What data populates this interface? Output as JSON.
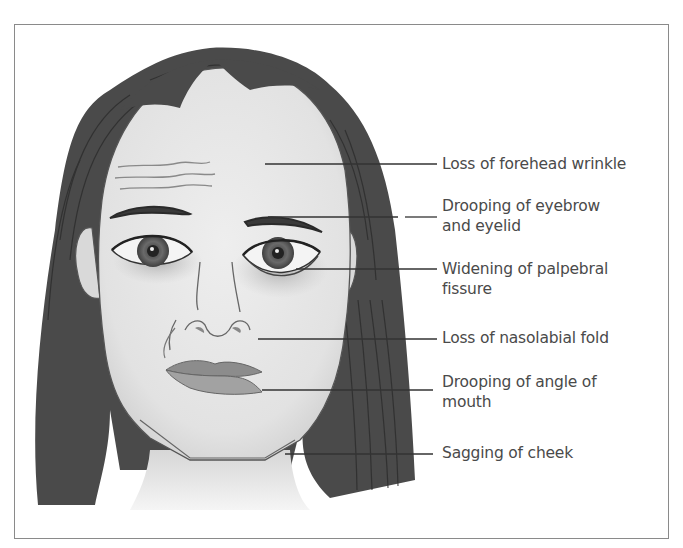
{
  "figure": {
    "colors": {
      "hair": "#4a4a4a",
      "skin": "#e6e6e6",
      "outline": "#555555",
      "lips": "#8c8c8c",
      "label_text": "#4a4a4a",
      "leader_line": "#333333",
      "frame": "#8a8a8a"
    },
    "labels": [
      {
        "text_lines": [
          "Loss of forehead wrinkle"
        ],
        "target": "forehead"
      },
      {
        "text_lines": [
          "Drooping of eyebrow",
          "and eyelid"
        ],
        "target": "left-eyebrow"
      },
      {
        "text_lines": [
          "Widening of palpebral",
          "fissure"
        ],
        "target": "left-eye"
      },
      {
        "text_lines": [
          "Loss of nasolabial fold"
        ],
        "target": "left-nasolabial-area"
      },
      {
        "text_lines": [
          "Drooping of angle of",
          "mouth"
        ],
        "target": "left-mouth-corner"
      },
      {
        "text_lines": [
          "Sagging of cheek"
        ],
        "target": "left-cheek"
      }
    ]
  },
  "labels": {
    "l0a": "Loss of forehead wrinkle",
    "l1a": "Drooping of eyebrow",
    "l1b": "and eyelid",
    "l2a": "Widening of palpebral",
    "l2b": "fissure",
    "l3a": "Loss of nasolabial fold",
    "l4a": "Drooping of angle of",
    "l4b": "mouth",
    "l5a": "Sagging of cheek"
  }
}
